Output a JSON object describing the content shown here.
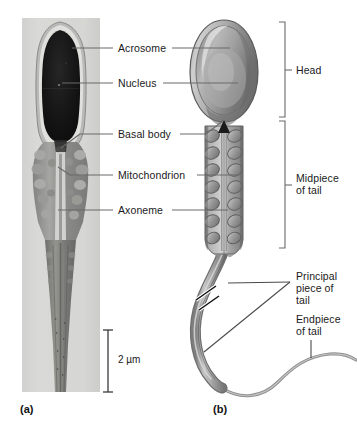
{
  "figure": {
    "background_color": "#ffffff",
    "line_color": "#4d4d4d",
    "text_color": "#1a1a1a"
  },
  "panels": [
    {
      "id": "a",
      "letter": "(a)",
      "type": "electron-micrograph",
      "x": 20,
      "y": 403
    },
    {
      "id": "b",
      "letter": "(b)",
      "type": "illustration",
      "x": 213,
      "y": 403
    }
  ],
  "micrograph": {
    "frame": {
      "x": 22,
      "y": 18,
      "width": 78,
      "height": 374
    },
    "background_color": "#d9d9d7",
    "nucleus_color": "#151515",
    "midpiece_color": "#8e8e8e",
    "tail_color": "#6f6f6f"
  },
  "scale_bar": {
    "label": "2 µm",
    "x": 108,
    "y_top": 330,
    "y_bottom": 392,
    "text_x": 118,
    "text_y": 355
  },
  "labels": [
    {
      "key": "acrosome",
      "text": "Acrosome",
      "text_x": 118,
      "text_y": 42,
      "left_line": {
        "x1": 113,
        "y1": 48,
        "x2": 72,
        "y2": 48
      },
      "right_line": {
        "x1": 172,
        "y1": 48,
        "x2": 228,
        "y2": 48
      }
    },
    {
      "key": "nucleus",
      "text": "Nucleus",
      "text_x": 118,
      "text_y": 77,
      "left_line": {
        "x1": 113,
        "y1": 83,
        "x2": 62,
        "y2": 83
      },
      "right_line": {
        "x1": 163,
        "y1": 83,
        "x2": 236,
        "y2": 83
      }
    },
    {
      "key": "basal-body",
      "text": "Basal body",
      "text_x": 118,
      "text_y": 128,
      "left_line": {
        "x1": 113,
        "y1": 134,
        "x2": 66,
        "y2": 134
      },
      "right_line": {
        "x1": 180,
        "y1": 134,
        "x2": 232,
        "y2": 134
      }
    },
    {
      "key": "mitochondrion",
      "text": "Mitochondrion",
      "text_x": 118,
      "text_y": 169,
      "left_line": {
        "x1": 113,
        "y1": 175,
        "x2": 64,
        "y2": 175
      },
      "right_line": {
        "x1": 195,
        "y1": 175,
        "x2": 238,
        "y2": 175
      }
    },
    {
      "key": "axoneme",
      "text": "Axoneme",
      "text_x": 118,
      "text_y": 204,
      "left_line": {
        "x1": 113,
        "y1": 210,
        "x2": 58,
        "y2": 210
      },
      "right_line": {
        "x1": 170,
        "y1": 210,
        "x2": 228,
        "y2": 210
      }
    }
  ],
  "brackets": [
    {
      "key": "head",
      "text": "Head",
      "text_x": 300,
      "text_y": 64,
      "x": 285,
      "y_top": 22,
      "y_bottom": 117,
      "tick_y": 70
    },
    {
      "key": "midpiece-of-tail",
      "text": "Midpiece\nof tail",
      "text_x": 300,
      "text_y": 178,
      "x": 285,
      "y_top": 121,
      "y_bottom": 248,
      "tick_y": 185
    }
  ],
  "tail_labels": [
    {
      "key": "principal-piece-of-tail",
      "text": "Principal\npiece of\ntail",
      "text_x": 296,
      "text_y": 272,
      "leader_from": {
        "x": 290,
        "y": 282
      },
      "leader_to_upper": {
        "x": 228,
        "y": 285
      },
      "leader_to_lower": {
        "x": 212,
        "y": 350
      }
    },
    {
      "key": "endpiece-of-tail",
      "text": "Endpiece\nof tail",
      "text_x": 296,
      "text_y": 315,
      "leader_from": {
        "x": 311,
        "y": 340
      },
      "leader_to": {
        "x": 311,
        "y": 357
      }
    }
  ],
  "anatomy": {
    "head_label": "Head",
    "midpiece_label": "Midpiece of tail",
    "principal_label": "Principal piece of tail",
    "endpiece_label": "Endpiece of tail",
    "acrosome_label": "Acrosome",
    "nucleus_label": "Nucleus",
    "basal_body_label": "Basal body",
    "mitochondrion_label": "Mitochondrion",
    "axoneme_label": "Axoneme"
  }
}
